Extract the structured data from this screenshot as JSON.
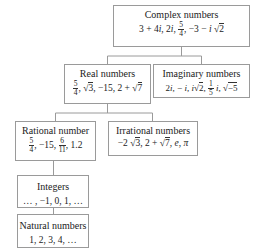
{
  "diagram": {
    "nodes": {
      "complex": {
        "title": "Complex numbers",
        "examples": "3 + 4i, 2i, 5/4, −3 − i√2"
      },
      "real": {
        "title": "Real numbers",
        "examples": "5/4, √3, −15, 2 + √7"
      },
      "imaginary": {
        "title": "Imaginary numbers",
        "examples": "2i, − i, i√2, 1/5 i, √−5"
      },
      "rational": {
        "title": "Rational number",
        "examples": "5/4, −15, 6/11, 1.2"
      },
      "irrational": {
        "title": "Irrational numbers",
        "examples": "−2√3, 2 + √7, e, π"
      },
      "integers": {
        "title": "Integers",
        "examples": "… , −1, 0, 1, …"
      },
      "natural": {
        "title": "Natural numbers",
        "examples": "1, 2, 3, 4, …"
      }
    },
    "edges": [
      [
        "complex",
        "real"
      ],
      [
        "complex",
        "imaginary"
      ],
      [
        "real",
        "rational"
      ],
      [
        "real",
        "irrational"
      ],
      [
        "rational",
        "integers"
      ],
      [
        "integers",
        "natural"
      ]
    ],
    "colors": {
      "border": "#9a9a9a",
      "line": "#9a9a9a",
      "text": "#222222"
    }
  }
}
